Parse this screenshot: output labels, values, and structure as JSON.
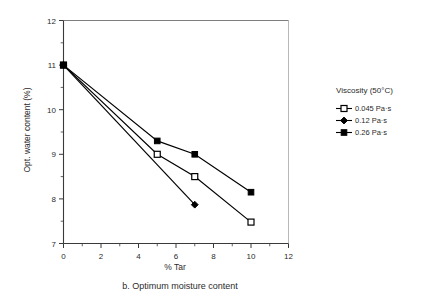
{
  "figure": {
    "caption": "b. Optimum moisture content"
  },
  "axes": {
    "x": {
      "label": "% Tar",
      "min": 0,
      "max": 12,
      "ticks": [
        0,
        2,
        4,
        6,
        8,
        10,
        12
      ],
      "tick_labels": [
        "0",
        "2",
        "4",
        "6",
        "8",
        "10",
        "12"
      ],
      "minor_step": 1
    },
    "y": {
      "label": "Opt. water content (%)",
      "min": 7,
      "max": 12,
      "ticks": [
        7,
        8,
        9,
        10,
        11,
        12
      ],
      "tick_labels": [
        "7",
        "8",
        "9",
        "10",
        "11",
        "12"
      ],
      "minor_step": 0.5
    }
  },
  "legend": {
    "title": "Viscosity (50°C)",
    "position": "right",
    "entries": [
      {
        "label": "0.045 Pa·s",
        "marker": "open-square",
        "color": "#000000"
      },
      {
        "label": "0.12 Pa·s",
        "marker": "filled-diamond",
        "color": "#000000"
      },
      {
        "label": "0.26 Pa·s",
        "marker": "filled-square",
        "color": "#000000"
      }
    ]
  },
  "chart_data": {
    "type": "line",
    "title": "b. Optimum moisture content",
    "xlabel": "% Tar",
    "ylabel": "Opt. water content (%)",
    "xlim": [
      0,
      12
    ],
    "ylim": [
      7,
      12
    ],
    "grid": false,
    "legend_title": "Viscosity (50°C)",
    "legend_position": "right",
    "series": [
      {
        "name": "0.045 Pa·s",
        "marker": "open-square",
        "color": "#000000",
        "x": [
          0,
          5,
          7,
          10
        ],
        "y": [
          11.0,
          9.0,
          8.5,
          7.48
        ]
      },
      {
        "name": "0.12 Pa·s",
        "marker": "filled-diamond",
        "color": "#000000",
        "x": [
          0,
          7
        ],
        "y": [
          11.0,
          7.87
        ]
      },
      {
        "name": "0.26 Pa·s",
        "marker": "filled-square",
        "color": "#000000",
        "x": [
          0,
          5,
          7,
          10
        ],
        "y": [
          11.0,
          9.3,
          9.0,
          8.15
        ]
      }
    ]
  }
}
